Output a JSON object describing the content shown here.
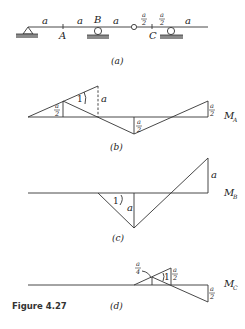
{
  "figure": {
    "caption": "Figure 4.27",
    "length_unit": "a",
    "half_unit": {
      "num": "a",
      "den": "2"
    },
    "quarter_unit": {
      "num": "a",
      "den": "4"
    }
  },
  "beam": {
    "panel_label": "(a)",
    "points": {
      "A": "A",
      "B": "B",
      "C": "C"
    },
    "spans": [
      "a",
      "a",
      "a",
      "a/2",
      "a/2",
      "a"
    ],
    "supports": [
      "pin",
      "roller-B",
      "roller-C"
    ],
    "hinge": "internal-hinge"
  },
  "influence_lines": [
    {
      "panel_label": "(b)",
      "name": "M",
      "subscript": "A",
      "labels": {
        "half_left": "a/2",
        "slope": "1",
        "height": "a",
        "half_mid": "a/2",
        "half_right": "a/2"
      }
    },
    {
      "panel_label": "(c)",
      "name": "M",
      "subscript": "B",
      "labels": {
        "slope": "1",
        "depth": "a",
        "height_right": "a"
      }
    },
    {
      "panel_label": "(d)",
      "name": "M",
      "subscript": "C",
      "labels": {
        "quarter": "a/4",
        "slope": "1",
        "half_top": "a/2",
        "half_right": "a/2"
      }
    }
  ]
}
